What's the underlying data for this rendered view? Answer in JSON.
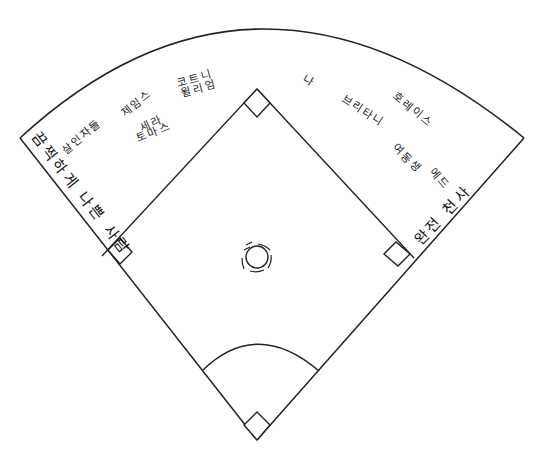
{
  "colors": {
    "line": "#222222",
    "text": "#222222",
    "background": "#ffffff"
  },
  "field": {
    "home_plate": [
      257,
      440
    ],
    "second_base": [
      257,
      89
    ],
    "first_base": [
      414,
      258
    ],
    "third_base": [
      102,
      256
    ],
    "left_foul_end": [
      20,
      138
    ],
    "right_foul_end": [
      524,
      138
    ],
    "outfield_top": [
      257,
      26
    ],
    "pitchers_mound": [
      257,
      257
    ]
  },
  "labels": {
    "left_foul_line": "끔찍하게 나쁜 사람",
    "right_foul_line": "완전 천사",
    "killer": "살인자들",
    "james": "제임스",
    "sarah": "세라",
    "thomas": "토마스",
    "courtney": "코트니",
    "william": "윌리엄",
    "me": "나",
    "brittany": "브리타니",
    "horace": "호레이스",
    "younger_sibling": "여동생",
    "ed": "에드"
  }
}
